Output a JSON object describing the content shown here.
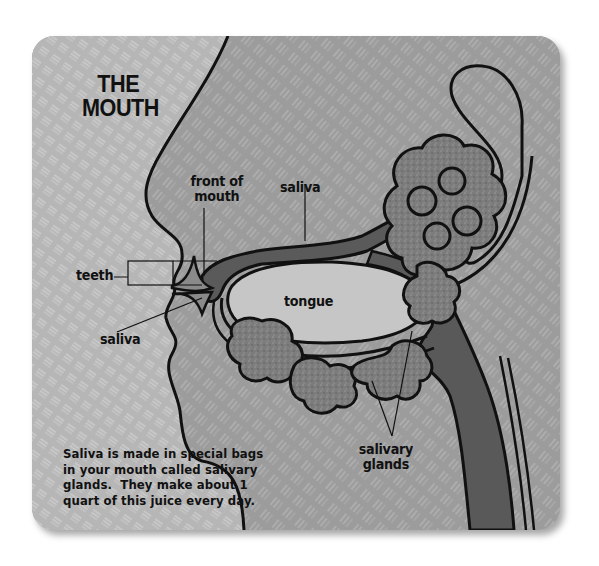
{
  "diagram": {
    "title_line1": "THE",
    "title_line2": "MOUTH",
    "labels": {
      "front_of_mouth_line1": "front of",
      "front_of_mouth_line2": "mouth",
      "saliva_top": "saliva",
      "teeth": "teeth",
      "tongue": "tongue",
      "saliva_bottom": "saliva",
      "salivary_glands_line1": "salivary",
      "salivary_glands_line2": "glands"
    },
    "caption": [
      "Saliva is made in special bags",
      "in your mouth called salivary",
      "glands.  They make about 1",
      "quart of this juice every day."
    ],
    "colors": {
      "outside_bg": "#b4b4b4",
      "face_bg": "#9a9a9a",
      "dark_tissue": "#5e5e5e",
      "glands": "#7e7e7e",
      "tongue": "#c4c4c4",
      "outline": "#111111"
    }
  }
}
